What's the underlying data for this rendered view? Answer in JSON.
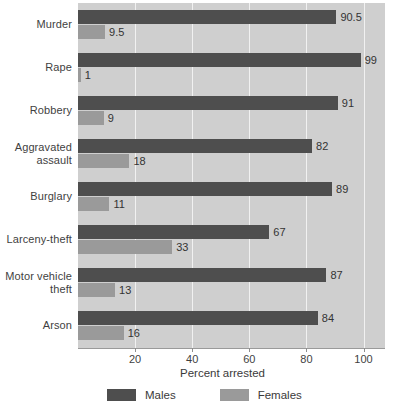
{
  "chart_data": {
    "type": "bar",
    "orientation": "horizontal",
    "title": "",
    "xlabel": "Percent arrested",
    "ylabel": "",
    "xlim": [
      0,
      108
    ],
    "xticks": [
      20,
      40,
      60,
      80,
      100
    ],
    "grid": true,
    "legend_position": "bottom",
    "categories": [
      "Murder",
      "Rape",
      "Robbery",
      "Aggravated assault",
      "Burglary",
      "Larceny-theft",
      "Motor vehicle theft",
      "Arson"
    ],
    "category_lines": [
      [
        "Murder"
      ],
      [
        "Rape"
      ],
      [
        "Robbery"
      ],
      [
        "Aggravated",
        "assault"
      ],
      [
        "Burglary"
      ],
      [
        "Larceny-theft"
      ],
      [
        "Motor vehicle",
        "theft"
      ],
      [
        "Arson"
      ]
    ],
    "series": [
      {
        "name": "Males",
        "color": "#4e4e4e",
        "values": [
          90.5,
          99,
          91,
          82,
          89,
          67,
          87,
          84
        ],
        "value_labels": [
          "90.5",
          "99",
          "91",
          "82",
          "89",
          "67",
          "87",
          "84"
        ]
      },
      {
        "name": "Females",
        "color": "#9a9a9a",
        "values": [
          9.5,
          1,
          9,
          18,
          11,
          33,
          13,
          16
        ],
        "value_labels": [
          "9.5",
          "1",
          "9",
          "18",
          "11",
          "33",
          "13",
          "16"
        ]
      }
    ]
  },
  "legend": {
    "items": [
      {
        "label": "Males",
        "color": "#4e4e4e"
      },
      {
        "label": "Females",
        "color": "#9a9a9a"
      }
    ]
  },
  "axis": {
    "title": "Percent arrested",
    "tick_labels": [
      "20",
      "40",
      "60",
      "80",
      "100"
    ]
  },
  "colors": {
    "males": "#4e4e4e",
    "females": "#9a9a9a",
    "plot_background": "#cfcfcf",
    "gridline": "#f1f1f1",
    "page_background": "#ffffff",
    "text": "#3a3a3a"
  }
}
